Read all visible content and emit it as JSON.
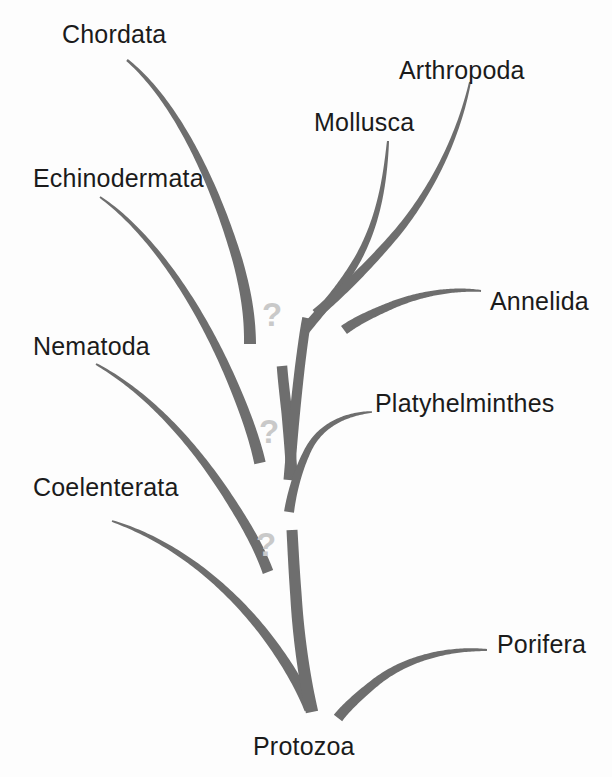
{
  "figure": {
    "kind": "phylogenetic-tree",
    "background_color": "#fdfdfd",
    "branch_color": "#6e6e6e",
    "branch_color_light": "#8a8a8a",
    "label_color": "#1b1b1b",
    "question_mark_color": "#c9c9c9"
  },
  "labels": [
    {
      "id": "chordata",
      "text": "Chordata",
      "x": 62,
      "y": 22,
      "align": "left"
    },
    {
      "id": "arthropoda",
      "text": "Arthropoda",
      "x": 399,
      "y": 58,
      "align": "left"
    },
    {
      "id": "mollusca",
      "text": "Mollusca",
      "x": 314,
      "y": 110,
      "align": "left"
    },
    {
      "id": "echinodermata",
      "text": "Echinodermata",
      "x": 33,
      "y": 166,
      "align": "left"
    },
    {
      "id": "annelida",
      "text": "Annelida",
      "x": 490,
      "y": 289,
      "align": "left"
    },
    {
      "id": "nematoda",
      "text": "Nematoda",
      "x": 33,
      "y": 334,
      "align": "left"
    },
    {
      "id": "platyhelminthes",
      "text": "Platyhelminthes",
      "x": 375,
      "y": 391,
      "align": "left"
    },
    {
      "id": "coelenterata",
      "text": "Coelenterata",
      "x": 33,
      "y": 475,
      "align": "left"
    },
    {
      "id": "porifera",
      "text": "Porifera",
      "x": 497,
      "y": 632,
      "align": "left"
    },
    {
      "id": "protozoa",
      "text": "Protozoa",
      "x": 253,
      "y": 734,
      "align": "left"
    }
  ],
  "question_marks": [
    {
      "id": "q-upper",
      "text": "?",
      "x": 262,
      "y": 298
    },
    {
      "id": "q-middle",
      "text": "?",
      "x": 259,
      "y": 415
    },
    {
      "id": "q-lower",
      "text": "?",
      "x": 256,
      "y": 528
    }
  ],
  "chart_data": {
    "type": "diagram",
    "title": "",
    "subtitle": "",
    "root": "Protozoa",
    "taxa": [
      "Chordata",
      "Echinodermata",
      "Nematoda",
      "Coelenterata",
      "Mollusca",
      "Arthropoda",
      "Annelida",
      "Platyhelminthes",
      "Porifera",
      "Protozoa"
    ],
    "uncertainty_markers": 3,
    "uncertainty_symbol": "?"
  },
  "branches": [
    {
      "id": "chordata-branch",
      "taxon": "Chordata",
      "path": "M 127 60 C 175 100 214 180 238 262 C 246 292 250 316 250 344",
      "width_tip": 2.4,
      "width_base": 12.0
    },
    {
      "id": "echinodermata-branch",
      "taxon": "Echinodermata",
      "path": "M 100 197 C 150 232 196 300 228 372 C 243 406 254 436 260 463",
      "width_tip": 1.8,
      "width_base": 11.5
    },
    {
      "id": "nematoda-branch",
      "taxon": "Nematoda",
      "path": "M 96 364 C 150 394 196 446 232 503 C 248 528 260 550 268 572",
      "width_tip": 1.8,
      "width_base": 11.0
    },
    {
      "id": "coelenterata-branch",
      "taxon": "Coelenterata",
      "path": "M 112 521 C 170 540 222 580 262 630 C 284 658 300 685 310 709",
      "width_tip": 1.8,
      "width_base": 11.5
    },
    {
      "id": "trunk-lower",
      "taxon": "Protozoa",
      "path": "M 312 712 C 303 672 298 630 296 596 C 294 570 293 548 292 530",
      "width_tip": 12.5,
      "width_base": 11.0
    },
    {
      "id": "trunk-middle",
      "taxon": "",
      "path": "M 292 478 C 291 458 289 436 287 414 C 285 396 283 380 282 366",
      "width_tip": 11.5,
      "width_base": 10.5
    },
    {
      "id": "trunk-upper",
      "taxon": "",
      "path": "M 289 480 C 292 440 296 400 300 366 C 303 342 305 328 307 318",
      "width_tip": 11.0,
      "width_base": 9.5
    },
    {
      "id": "mollusca-branch",
      "taxon": "Mollusca",
      "path": "M 388 141 C 385 180 379 222 356 262 C 336 296 316 316 305 330",
      "width_tip": 2.0,
      "width_base": 10.0
    },
    {
      "id": "arthropoda-branch",
      "taxon": "Arthropoda",
      "path": "M 470 82 C 460 130 436 186 396 234 C 360 276 332 300 316 314",
      "width_tip": 1.8,
      "width_base": 10.5
    },
    {
      "id": "annelida-branch",
      "taxon": "Annelida",
      "path": "M 481 291 C 452 288 418 294 390 306 C 366 316 352 324 344 330",
      "width_tip": 1.8,
      "width_base": 10.0
    },
    {
      "id": "platyhelminthes-branch",
      "taxon": "Platyhelminthes",
      "path": "M 372 412 C 344 414 320 426 308 450 C 298 470 292 492 289 512",
      "width_tip": 1.6,
      "width_base": 10.0
    },
    {
      "id": "porifera-branch",
      "taxon": "Porifera",
      "path": "M 487 650 C 444 648 404 660 376 682 C 356 698 344 710 338 718",
      "width_tip": 2.0,
      "width_base": 10.5
    }
  ]
}
